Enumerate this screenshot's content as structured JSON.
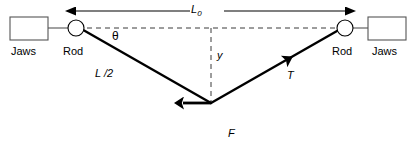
{
  "diagram": {
    "colors": {
      "stroke": "#000000",
      "dashed": "#3a3a3a",
      "background": "#ffffff"
    },
    "labels": {
      "jaws_left": "Jaws",
      "rod_left": "Rod",
      "jaws_right": "Jaws",
      "rod_right": "Rod",
      "length_total": "L",
      "length_total_subscript": "0",
      "angle": "θ",
      "half_length": "L /2",
      "sag": "y",
      "tension": "T",
      "force": "F"
    },
    "geometry": {
      "jaws_left_box": {
        "x": 10,
        "y": 17,
        "w": 38,
        "h": 23
      },
      "jaws_right_box": {
        "x": 368,
        "y": 17,
        "w": 38,
        "h": 23
      },
      "rod_left_circle": {
        "cx": 76,
        "cy": 28,
        "r": 8
      },
      "rod_right_circle": {
        "cx": 345,
        "cy": 28,
        "r": 8
      },
      "vertex": {
        "x": 211,
        "y": 103
      },
      "dashed_horizontal": {
        "x1": 76,
        "y1": 28,
        "x2": 345,
        "y2": 28
      },
      "dashed_vertical": {
        "x1": 211,
        "y1": 28,
        "x2": 211,
        "y2": 103
      },
      "dimension_arrow": {
        "x1": 73,
        "y1": 11,
        "x2": 348,
        "y2": 11
      },
      "force_arrow": {
        "x1": 211,
        "y1": 103,
        "x2": 211,
        "y2": 146
      },
      "tension_arrow": {
        "x1": 211,
        "y1": 103,
        "x2": 290,
        "y2": 66
      }
    }
  }
}
